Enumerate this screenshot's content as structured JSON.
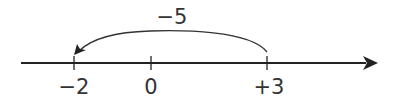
{
  "diagram": {
    "type": "number-line",
    "jump_label": "−5",
    "ticks": [
      {
        "value": -2,
        "label": "−2"
      },
      {
        "value": 0,
        "label": "0"
      },
      {
        "value": 3,
        "label": "+3"
      }
    ],
    "jump": {
      "from": 3,
      "to": -2
    },
    "colors": {
      "line": "#222222",
      "text": "#333333"
    }
  }
}
